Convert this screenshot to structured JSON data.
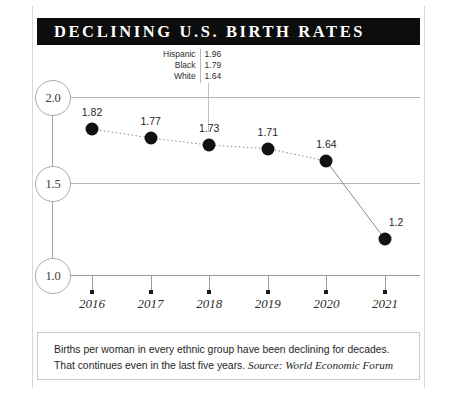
{
  "title": "DECLINING U.S. BIRTH RATES",
  "annotation": {
    "rows": [
      {
        "label": "Hispanic",
        "value": "1.96"
      },
      {
        "label": "Black",
        "value": "1.79"
      },
      {
        "label": "White",
        "value": "1.64"
      }
    ]
  },
  "footer": {
    "line1": "Births per woman in every ethnic group have been declining for decades.",
    "line2": "That continues even in the last five years.",
    "source": "Source: World Economic Forum"
  },
  "colors": {
    "banner_bg": "#0d0d0d",
    "banner_text": "#ffffff",
    "point": "#111111",
    "gridline": "#b5b5b5",
    "axis": "#a8a8a8"
  },
  "chart_data": {
    "type": "line",
    "title": "DECLINING U.S. BIRTH RATES",
    "xlabel": "",
    "ylabel": "",
    "categories": [
      "2016",
      "2017",
      "2018",
      "2019",
      "2020",
      "2021"
    ],
    "values": [
      1.82,
      1.77,
      1.73,
      1.71,
      1.64,
      1.2
    ],
    "point_labels": [
      "1.82",
      "1.77",
      "1.73",
      "1.71",
      "1.64",
      "1.2"
    ],
    "ylim": [
      1.0,
      2.0
    ],
    "ytick_labels": [
      "2.0",
      "1.5",
      "1.0"
    ],
    "ytick_values": [
      2.0,
      1.5,
      1.0
    ],
    "grid": true,
    "legend_position": "none",
    "annotations": [
      {
        "label": "Hispanic",
        "value": 1.96
      },
      {
        "label": "Black",
        "value": 1.79
      },
      {
        "label": "White",
        "value": 1.64
      }
    ],
    "series": [
      {
        "name": "Births per woman",
        "values": [
          1.82,
          1.77,
          1.73,
          1.71,
          1.64,
          1.2
        ]
      }
    ]
  }
}
